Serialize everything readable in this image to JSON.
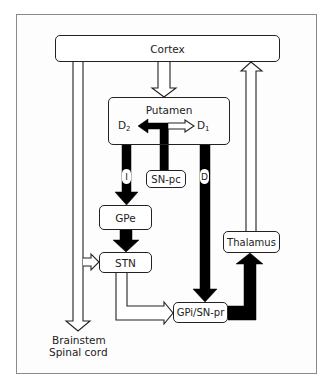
{
  "diagram": {
    "nodes": {
      "cortex": "Cortex",
      "putamen": "Putamen",
      "snpc": "SN-pc",
      "gpe": "GPe",
      "stn": "STN",
      "gpi": "GPi/SN-pr",
      "thalamus": "Thalamus"
    },
    "receptors": {
      "d2": {
        "letter": "D",
        "sub": "2"
      },
      "d1": {
        "letter": "D",
        "sub": "1"
      }
    },
    "pathways": {
      "indirect": "I",
      "direct": "D"
    },
    "output": {
      "line1": "Brainstem",
      "line2": "Spinal cord"
    },
    "edges": [
      {
        "from": "Cortex",
        "to": "Putamen",
        "style": "open-arrow"
      },
      {
        "from": "Cortex",
        "to": "Brainstem/Spinal cord",
        "style": "open-arrow"
      },
      {
        "from": "Cortex",
        "to": "STN",
        "style": "open-arrow"
      },
      {
        "from": "SN-pc",
        "to": "D2",
        "style": "filled-arrow"
      },
      {
        "from": "SN-pc",
        "to": "D1",
        "style": "open-arrow"
      },
      {
        "from": "Putamen",
        "to": "GPe",
        "style": "filled-arrow",
        "label": "I"
      },
      {
        "from": "Putamen",
        "to": "GPi/SN-pr",
        "style": "filled-arrow",
        "label": "D"
      },
      {
        "from": "GPe",
        "to": "STN",
        "style": "filled-arrow"
      },
      {
        "from": "STN",
        "to": "GPi/SN-pr",
        "style": "open-arrow"
      },
      {
        "from": "GPi/SN-pr",
        "to": "Thalamus",
        "style": "filled-arrow"
      },
      {
        "from": "Thalamus",
        "to": "Cortex",
        "style": "open-arrow"
      }
    ],
    "colors": {
      "stroke": "#222222",
      "fill_inhibitory": "#000000",
      "fill_excitatory": "#ffffff",
      "frame": "#8a8a8a"
    }
  }
}
